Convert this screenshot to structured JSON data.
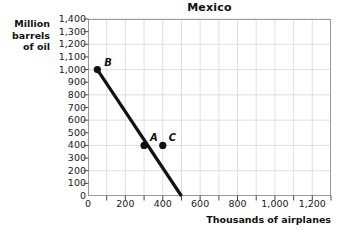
{
  "chart_data": {
    "type": "line",
    "title": "Mexico",
    "xlabel": "Thousands of airplanes",
    "ylabel": "Million barrels of oil",
    "ylabel_lines": [
      "Million",
      "barrels",
      "of oil"
    ],
    "xlim": [
      0,
      1300
    ],
    "ylim": [
      0,
      1400
    ],
    "xtick_step": 100,
    "ytick_step": 100,
    "xticks": [
      0,
      100,
      200,
      300,
      400,
      500,
      600,
      700,
      800,
      900,
      1000,
      1100,
      1200,
      1300
    ],
    "yticks": [
      0,
      100,
      200,
      300,
      400,
      500,
      600,
      700,
      800,
      900,
      1000,
      1100,
      1200,
      1300,
      1400
    ],
    "xtick_labels": [
      "0",
      "",
      "200",
      "",
      "400",
      "",
      "600",
      "",
      "800",
      "",
      "1,000",
      "",
      "1,200",
      ""
    ],
    "ytick_labels": [
      "0",
      "100",
      "200",
      "300",
      "400",
      "500",
      "600",
      "700",
      "800",
      "900",
      "1,000",
      "1,100",
      "1,200",
      "1,300",
      "1,400"
    ],
    "grid": true,
    "grid_x_step": 100,
    "grid_y_step": 200,
    "grid_color": "#d8d8dc",
    "legend": null,
    "series": [
      {
        "name": "production possibilities frontier",
        "type": "line",
        "color": "#111111",
        "width": 3.2,
        "x": [
          50,
          500
        ],
        "y": [
          1000,
          0
        ]
      }
    ],
    "points": [
      {
        "label": "B",
        "x": 50,
        "y": 1000,
        "on_curve": true,
        "label_dx": 7,
        "label_dy": -6
      },
      {
        "label": "A",
        "x": 300,
        "y": 400,
        "on_curve": true,
        "label_dx": 6,
        "label_dy": -6
      },
      {
        "label": "C",
        "x": 400,
        "y": 400,
        "on_curve": false,
        "label_dx": 6,
        "label_dy": -6
      }
    ],
    "annotations": []
  }
}
